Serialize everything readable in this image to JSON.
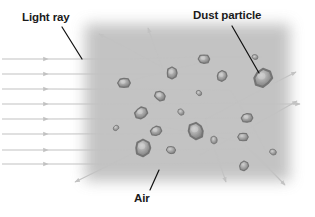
{
  "diagram": {
    "type": "physics-illustration",
    "width": 315,
    "height": 217,
    "background_color": "#ffffff"
  },
  "labels": [
    {
      "key": "light_ray",
      "text": "Light ray",
      "position": {
        "x": 22,
        "y": 11
      },
      "leader_line": {
        "x1": 62,
        "y1": 27,
        "x2": 82,
        "y2": 59
      }
    },
    {
      "key": "dust_particle",
      "text": "Dust particle",
      "position": {
        "x": 193,
        "y": 9
      },
      "leader_line": {
        "x1": 232,
        "y1": 26,
        "x2": 259,
        "y2": 73
      }
    },
    {
      "key": "air",
      "text": "Air",
      "position": {
        "x": 134,
        "y": 192
      },
      "leader_line": {
        "x1": 150,
        "y1": 190,
        "x2": 159,
        "y2": 170
      }
    }
  ],
  "air_region": {
    "name": "air-medium",
    "x": 85,
    "y": 24,
    "width": 205,
    "height": 157,
    "fill_color": "#b9b9b9",
    "edge_softness_px": 14
  },
  "ray_style": {
    "stroke_color": "#c2c2c2",
    "stroke_width": 1.1,
    "arrow_length": 5,
    "arrow_width": 4
  },
  "incoming_rays": [
    {
      "x1": 2,
      "y1": 59,
      "x2": 48,
      "y2": 59
    },
    {
      "x1": 2,
      "y1": 74,
      "x2": 48,
      "y2": 74
    },
    {
      "x1": 2,
      "y1": 89,
      "x2": 48,
      "y2": 89
    },
    {
      "x1": 2,
      "y1": 104,
      "x2": 48,
      "y2": 104
    },
    {
      "x1": 2,
      "y1": 119,
      "x2": 48,
      "y2": 119
    },
    {
      "x1": 2,
      "y1": 134,
      "x2": 48,
      "y2": 134
    },
    {
      "x1": 2,
      "y1": 150,
      "x2": 48,
      "y2": 150
    },
    {
      "x1": 2,
      "y1": 164,
      "x2": 48,
      "y2": 164
    }
  ],
  "ray_paths": [
    {
      "name": "ray-1-through",
      "points": [
        [
          48,
          59
        ],
        [
          128,
          59
        ],
        [
          200,
          57
        ],
        [
          262,
          57
        ]
      ],
      "arrow": false
    },
    {
      "name": "ray-2-through",
      "points": [
        [
          48,
          74
        ],
        [
          130,
          74
        ],
        [
          215,
          74
        ]
      ],
      "arrow": false
    },
    {
      "name": "ray-3-through",
      "points": [
        [
          48,
          89
        ],
        [
          140,
          89
        ],
        [
          230,
          90
        ]
      ],
      "arrow": false
    },
    {
      "name": "ray-4-through",
      "points": [
        [
          48,
          104
        ],
        [
          150,
          104
        ],
        [
          245,
          103
        ]
      ],
      "arrow": false
    },
    {
      "name": "ray-5-through",
      "points": [
        [
          48,
          119
        ],
        [
          150,
          119
        ],
        [
          250,
          118
        ]
      ],
      "arrow": false
    },
    {
      "name": "ray-6-through",
      "points": [
        [
          48,
          134
        ],
        [
          150,
          134
        ],
        [
          255,
          133
        ]
      ],
      "arrow": false
    },
    {
      "name": "ray-7-through",
      "points": [
        [
          48,
          150
        ],
        [
          140,
          150
        ],
        [
          250,
          149
        ]
      ],
      "arrow": false
    },
    {
      "name": "ray-8-through",
      "points": [
        [
          48,
          164
        ],
        [
          140,
          164
        ],
        [
          240,
          163
        ]
      ],
      "arrow": false
    },
    {
      "name": "scatter-up-left",
      "points": [
        [
          160,
          66
        ],
        [
          128,
          48
        ],
        [
          99,
          34
        ]
      ],
      "arrow": true
    },
    {
      "name": "scatter-up-steep",
      "points": [
        [
          163,
          70
        ],
        [
          155,
          48
        ],
        [
          148,
          28
        ]
      ],
      "arrow": true
    },
    {
      "name": "scatter-up-right-1",
      "points": [
        [
          205,
          120
        ],
        [
          250,
          95
        ],
        [
          296,
          72
        ]
      ],
      "arrow": true
    },
    {
      "name": "scatter-right-flat",
      "points": [
        [
          240,
          104
        ],
        [
          270,
          104
        ],
        [
          300,
          104
        ]
      ],
      "arrow": true
    },
    {
      "name": "scatter-up-right-2",
      "points": [
        [
          200,
          155
        ],
        [
          250,
          128
        ],
        [
          297,
          101
        ]
      ],
      "arrow": true
    },
    {
      "name": "scatter-down-right-1",
      "points": [
        [
          205,
          120
        ],
        [
          215,
          150
        ],
        [
          226,
          182
        ]
      ],
      "arrow": true
    },
    {
      "name": "scatter-down-right-2",
      "points": [
        [
          245,
          145
        ],
        [
          265,
          164
        ],
        [
          285,
          185
        ]
      ],
      "arrow": true
    },
    {
      "name": "scatter-down-left",
      "points": [
        [
          143,
          148
        ],
        [
          110,
          165
        ],
        [
          75,
          182
        ]
      ],
      "arrow": true
    },
    {
      "name": "scatter-internal-a",
      "points": [
        [
          120,
          84
        ],
        [
          160,
          72
        ],
        [
          205,
          62
        ]
      ],
      "arrow": false
    },
    {
      "name": "scatter-internal-b",
      "points": [
        [
          148,
          124
        ],
        [
          190,
          132
        ],
        [
          236,
          141
        ]
      ],
      "arrow": false
    },
    {
      "name": "scatter-internal-c",
      "points": [
        [
          230,
          90
        ],
        [
          250,
          120
        ],
        [
          268,
          155
        ]
      ],
      "arrow": false
    }
  ],
  "particles": [
    {
      "id": 1,
      "cx": 124,
      "cy": 83,
      "r": 6.0,
      "size": "medium"
    },
    {
      "id": 2,
      "cx": 172,
      "cy": 73,
      "r": 6.0,
      "size": "medium"
    },
    {
      "id": 3,
      "cx": 204,
      "cy": 59,
      "r": 5.5,
      "size": "medium"
    },
    {
      "id": 4,
      "cx": 222,
      "cy": 76,
      "r": 5.5,
      "size": "medium"
    },
    {
      "id": 5,
      "cx": 255,
      "cy": 57,
      "r": 3.0,
      "size": "small"
    },
    {
      "id": 6,
      "cx": 263,
      "cy": 78,
      "r": 9.5,
      "size": "large"
    },
    {
      "id": 7,
      "cx": 160,
      "cy": 96,
      "r": 5.5,
      "size": "medium"
    },
    {
      "id": 8,
      "cx": 141,
      "cy": 113,
      "r": 6.5,
      "size": "medium"
    },
    {
      "id": 9,
      "cx": 181,
      "cy": 112,
      "r": 3.5,
      "size": "small"
    },
    {
      "id": 10,
      "cx": 156,
      "cy": 131,
      "r": 5.5,
      "size": "medium"
    },
    {
      "id": 11,
      "cx": 196,
      "cy": 131,
      "r": 8.5,
      "size": "large"
    },
    {
      "id": 12,
      "cx": 247,
      "cy": 118,
      "r": 5.5,
      "size": "medium"
    },
    {
      "id": 13,
      "cx": 214,
      "cy": 140,
      "r": 4.0,
      "size": "small"
    },
    {
      "id": 14,
      "cx": 243,
      "cy": 137,
      "r": 5.0,
      "size": "medium"
    },
    {
      "id": 15,
      "cx": 143,
      "cy": 148,
      "r": 8.5,
      "size": "large"
    },
    {
      "id": 16,
      "cx": 171,
      "cy": 150,
      "r": 4.5,
      "size": "small"
    },
    {
      "id": 17,
      "cx": 244,
      "cy": 166,
      "r": 5.0,
      "size": "medium"
    },
    {
      "id": 18,
      "cx": 273,
      "cy": 152,
      "r": 3.5,
      "size": "small"
    },
    {
      "id": 19,
      "cx": 116,
      "cy": 128,
      "r": 3.0,
      "size": "small"
    },
    {
      "id": 20,
      "cx": 199,
      "cy": 93,
      "r": 3.0,
      "size": "small"
    }
  ],
  "particle_style": {
    "fill_color": "#a0a0a0",
    "rim_color": "#6e6e6e",
    "core_color": "#cfcfcf"
  },
  "leader_style": {
    "stroke_color": "#111111",
    "stroke_width": 1.2
  }
}
